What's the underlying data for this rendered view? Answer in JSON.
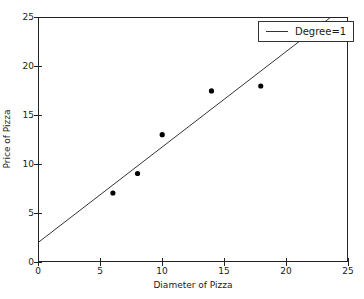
{
  "chart_data": {
    "type": "scatter",
    "title": "",
    "xlabel": "Diameter of Pizza",
    "ylabel": "Price of Pizza",
    "xlim": [
      0,
      25
    ],
    "ylim": [
      0,
      25
    ],
    "xticks": [
      0,
      5,
      10,
      15,
      20,
      25
    ],
    "yticks": [
      0,
      5,
      10,
      15,
      20,
      25
    ],
    "xticklabels": [
      "0",
      "5",
      "10",
      "15",
      "20",
      "25"
    ],
    "yticklabels": [
      "0",
      "5",
      "10",
      "15",
      "20",
      "25"
    ],
    "grid": false,
    "legend_position": "upper right",
    "series": [
      {
        "name": "observations",
        "type": "scatter",
        "marker": "circle",
        "color": "#000000",
        "x": [
          6,
          8,
          10,
          14,
          18
        ],
        "y": [
          7,
          9,
          13,
          17.5,
          18
        ]
      },
      {
        "name": "Degree=1",
        "type": "line",
        "color": "#333333",
        "slope": 0.9762,
        "intercept": 1.9655,
        "x": [
          0,
          25
        ],
        "y": [
          1.97,
          26.37
        ]
      }
    ]
  },
  "legend": {
    "entries": [
      {
        "label": "Degree=1",
        "color": "#333333"
      }
    ]
  },
  "colors": {
    "background": "#ffffff",
    "axis": "#222222",
    "marker": "#000000",
    "line": "#333333",
    "text": "#1a1a1a"
  }
}
